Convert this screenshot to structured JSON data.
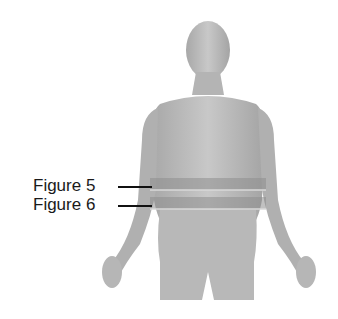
{
  "diagram": {
    "labels": [
      {
        "text": "Figure 5",
        "x": 33,
        "y": 177
      },
      {
        "text": "Figure 6",
        "x": 33,
        "y": 196
      }
    ],
    "bands": [
      {
        "name": "figure-5-band",
        "y": 178,
        "height": 12
      },
      {
        "name": "figure-6-band",
        "y": 197,
        "height": 12
      }
    ],
    "colors": {
      "skin": "#bdbdbd",
      "skin_dark": "#9a9a9a",
      "band": "#8a8a8a",
      "background": "#ffffff"
    }
  }
}
